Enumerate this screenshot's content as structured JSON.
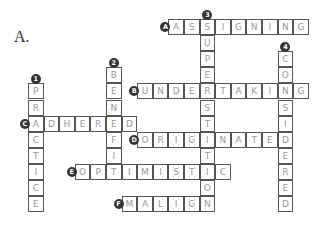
{
  "label": "A.",
  "grid": {
    "x0": 28,
    "y0": 19,
    "pitch_x": 15.6,
    "pitch_y": 16.1
  },
  "colors": {
    "border": "#555555",
    "letter": "#999999",
    "badge": "#333333"
  },
  "words": [
    {
      "id": "A",
      "word": "ASSIGNING",
      "dir": "across",
      "row": 0,
      "col": 9
    },
    {
      "id": "B",
      "word": "UNDERTAKING",
      "dir": "across",
      "row": 4,
      "col": 7
    },
    {
      "id": "C",
      "word": "ADHERED",
      "dir": "across",
      "row": 6,
      "col": 0
    },
    {
      "id": "D",
      "word": "ORIGINATED",
      "dir": "across",
      "row": 7,
      "col": 7
    },
    {
      "id": "E",
      "word": "OPTIMISTIC",
      "dir": "across",
      "row": 9,
      "col": 3
    },
    {
      "id": "F",
      "word": "MALIGN",
      "dir": "across",
      "row": 11,
      "col": 6
    },
    {
      "id": "1",
      "word": "PRACTICE",
      "dir": "down",
      "row": 4,
      "col": 0
    },
    {
      "id": "2",
      "word": "BENEFIT",
      "dir": "down",
      "row": 3,
      "col": 5
    },
    {
      "id": "3",
      "word": "SUPERSTITION",
      "dir": "down",
      "row": 0,
      "col": 11
    },
    {
      "id": "4",
      "word": "CONSIDERED",
      "dir": "down",
      "row": 2,
      "col": 16
    }
  ]
}
